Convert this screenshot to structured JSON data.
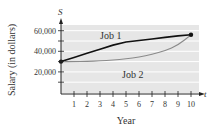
{
  "chart_data": {
    "type": "line",
    "title": "",
    "xlabel": "Year",
    "ylabel": "Salary (in dollars)",
    "x_axis_variable": "t",
    "y_axis_variable": "S",
    "xlim": [
      0,
      10
    ],
    "ylim": [
      0,
      65000
    ],
    "grid": true,
    "legend_position": "inline labels",
    "x_ticks": [
      "1",
      "2",
      "3",
      "4",
      "5",
      "6",
      "7",
      "8",
      "9",
      "10"
    ],
    "y_ticks": [
      "20,000",
      "40,000",
      "60,000"
    ],
    "x": [
      0,
      1,
      2,
      3,
      4,
      5,
      6,
      7,
      8,
      9,
      10
    ],
    "series": [
      {
        "name": "Job 1",
        "values": [
          30000,
          34000,
          38000,
          42000,
          46000,
          49000,
          50500,
          52000,
          53500,
          55000,
          56000
        ]
      },
      {
        "name": "Job 2",
        "values": [
          30000,
          30000,
          30200,
          30700,
          31500,
          32700,
          34300,
          37000,
          40500,
          46000,
          56000
        ]
      }
    ],
    "annotations": [
      "Job 1",
      "Job 2"
    ]
  },
  "labels": {
    "y_var": "S",
    "x_var": "t",
    "y_title": "Salary (in dollars)",
    "x_title": "Year",
    "job1": "Job 1",
    "job2": "Job 2"
  },
  "colors": {
    "plot_bg": "#e6e6e6",
    "gridline": "#ffffff",
    "job1_line": "#111111",
    "job2_line": "#8a8a8a",
    "axis": "#222222"
  }
}
